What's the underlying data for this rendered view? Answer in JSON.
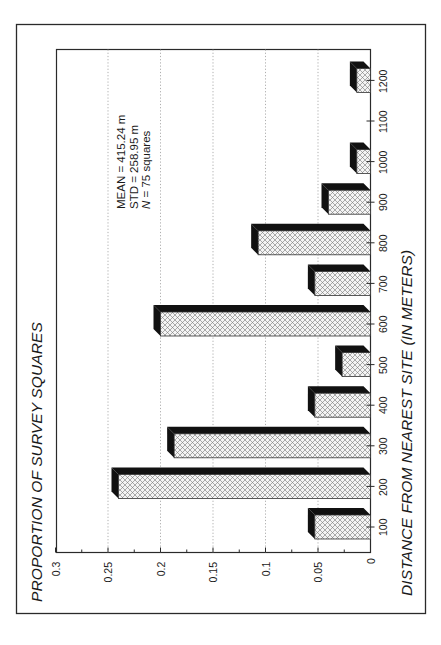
{
  "chart_data": {
    "type": "bar",
    "orientation": "rotated-90-ccw (page rotated; vertical bar chart rendered sideways)",
    "title": "PROPORTION OF SURVEY SQUARES",
    "ylabel": "PROPORTION OF SURVEY SQUARES",
    "xlabel": "DISTANCE FROM NEAREST SITE (IN METERS)",
    "categories": [
      "100",
      "200",
      "300",
      "400",
      "500",
      "600",
      "700",
      "800",
      "900",
      "1000",
      "1100",
      "1200"
    ],
    "values": [
      0.053,
      0.24,
      0.187,
      0.053,
      0.027,
      0.2,
      0.053,
      0.107,
      0.04,
      0.013,
      0,
      0.013
    ],
    "ylim": [
      0,
      0.3
    ],
    "yticks": [
      "0",
      "0.05",
      "0.1",
      "0.15",
      "0.2",
      "0.25",
      "0.3"
    ],
    "ytick_values": [
      0,
      0.05,
      0.1,
      0.15,
      0.2,
      0.25,
      0.3
    ],
    "grid": "dotted lines at major y ticks",
    "bar_style": "3D bars with crosshatch front face and black depth face",
    "annotations": [
      "MEAN = 415.24 m",
      "STD = 258.95 m",
      "N = 75 squares"
    ],
    "legend": null
  },
  "stats": {
    "mean_label": "MEAN",
    "mean_value": "=  415.24 m",
    "std_label": "STD",
    "std_value": "=  258.95 m",
    "n_label": "N",
    "n_value": "=  75 squares"
  },
  "colors": {
    "frame": "#2a2a2a",
    "bar_dark": "#111111",
    "bar_face": "#f4f4f4",
    "hatch": "#6a6a6a",
    "grid": "#9a9a9a"
  }
}
